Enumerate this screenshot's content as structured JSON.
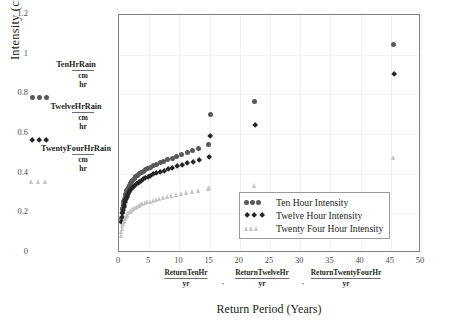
{
  "axes": {
    "ylabel": "Intensity (cm/hr)",
    "xlabel": "Return Period (Years)",
    "yticks": [
      "0",
      "0.2",
      "0.4",
      "0.6",
      "0.8",
      "1",
      "1.2"
    ],
    "xticks": [
      "0",
      "5",
      "10",
      "15",
      "20",
      "25",
      "30",
      "35",
      "40",
      "45",
      "50"
    ],
    "ylim": [
      0,
      1.2
    ],
    "xlim": [
      0,
      50
    ]
  },
  "variable_legend": [
    {
      "name": "TenHrRain",
      "numerator": "cm",
      "denominator": "hr",
      "marker": "circle",
      "color": "#595959"
    },
    {
      "name": "TwelveHrRain",
      "numerator": "cm",
      "denominator": "hr",
      "marker": "diamond",
      "color": "#262626"
    },
    {
      "name": "TwentyFourHrRain",
      "numerator": "cm",
      "denominator": "hr",
      "marker": "triangle",
      "color": "#c4c4c4"
    }
  ],
  "x_variable_labels": [
    {
      "name": "ReturnTenHr",
      "denominator": "yr"
    },
    {
      "name": "ReturnTwelveHr",
      "denominator": "yr"
    },
    {
      "name": "ReturnTwentyFourHr",
      "denominator": "yr"
    }
  ],
  "separator": ",",
  "legend": {
    "position": "inside-bottom-right",
    "items": [
      {
        "label": "Ten Hour Intensity",
        "marker": "circle",
        "color": "#595959"
      },
      {
        "label": "Twelve Hour Intensity",
        "marker": "diamond",
        "color": "#262626"
      },
      {
        "label": "Twenty Four Hour Intensity",
        "marker": "triangle",
        "color": "#c4c4c4"
      }
    ]
  },
  "chart_data": {
    "type": "scatter",
    "title": "",
    "xlabel": "Return Period (Years)",
    "ylabel": "Intensity (cm/hr)",
    "xlim": [
      0,
      50
    ],
    "ylim": [
      0,
      1.2
    ],
    "grid": true,
    "series": [
      {
        "name": "Ten Hour Intensity",
        "marker": "circle",
        "color": "#595959",
        "points": [
          [
            0.4,
            0.175
          ],
          [
            0.5,
            0.205
          ],
          [
            0.6,
            0.225
          ],
          [
            0.7,
            0.245
          ],
          [
            0.8,
            0.258
          ],
          [
            0.9,
            0.272
          ],
          [
            1.0,
            0.285
          ],
          [
            1.1,
            0.296
          ],
          [
            1.2,
            0.306
          ],
          [
            1.3,
            0.315
          ],
          [
            1.4,
            0.322
          ],
          [
            1.5,
            0.33
          ],
          [
            1.7,
            0.342
          ],
          [
            1.9,
            0.352
          ],
          [
            2.1,
            0.36
          ],
          [
            2.3,
            0.368
          ],
          [
            2.5,
            0.375
          ],
          [
            2.8,
            0.384
          ],
          [
            3.1,
            0.392
          ],
          [
            3.4,
            0.4
          ],
          [
            3.7,
            0.406
          ],
          [
            4.0,
            0.412
          ],
          [
            4.4,
            0.42
          ],
          [
            4.8,
            0.427
          ],
          [
            5.2,
            0.433
          ],
          [
            5.7,
            0.44
          ],
          [
            6.2,
            0.447
          ],
          [
            6.8,
            0.455
          ],
          [
            7.4,
            0.462
          ],
          [
            8.1,
            0.47
          ],
          [
            8.8,
            0.478
          ],
          [
            9.6,
            0.487
          ],
          [
            10.4,
            0.495
          ],
          [
            11.3,
            0.505
          ],
          [
            12.2,
            0.515
          ],
          [
            13.2,
            0.527
          ],
          [
            14.9,
            0.545
          ],
          [
            15.1,
            0.7
          ],
          [
            22.5,
            0.765
          ],
          [
            45.5,
            1.05
          ]
        ]
      },
      {
        "name": "Twelve Hour Intensity",
        "marker": "diamond",
        "color": "#262626",
        "points": [
          [
            0.4,
            0.155
          ],
          [
            0.5,
            0.18
          ],
          [
            0.6,
            0.2
          ],
          [
            0.7,
            0.218
          ],
          [
            0.8,
            0.23
          ],
          [
            0.9,
            0.243
          ],
          [
            1.0,
            0.254
          ],
          [
            1.1,
            0.264
          ],
          [
            1.2,
            0.273
          ],
          [
            1.3,
            0.281
          ],
          [
            1.4,
            0.288
          ],
          [
            1.5,
            0.295
          ],
          [
            1.7,
            0.306
          ],
          [
            1.9,
            0.315
          ],
          [
            2.1,
            0.322
          ],
          [
            2.3,
            0.33
          ],
          [
            2.5,
            0.336
          ],
          [
            2.8,
            0.345
          ],
          [
            3.1,
            0.352
          ],
          [
            3.4,
            0.358
          ],
          [
            3.7,
            0.364
          ],
          [
            4.0,
            0.37
          ],
          [
            4.4,
            0.377
          ],
          [
            4.8,
            0.383
          ],
          [
            5.2,
            0.389
          ],
          [
            5.7,
            0.395
          ],
          [
            6.2,
            0.401
          ],
          [
            6.8,
            0.408
          ],
          [
            7.4,
            0.414
          ],
          [
            8.1,
            0.421
          ],
          [
            8.8,
            0.428
          ],
          [
            9.6,
            0.436
          ],
          [
            10.4,
            0.443
          ],
          [
            11.3,
            0.452
          ],
          [
            12.2,
            0.46
          ],
          [
            13.2,
            0.47
          ],
          [
            14.9,
            0.485
          ],
          [
            15.1,
            0.59
          ],
          [
            22.5,
            0.645
          ],
          [
            45.5,
            0.9
          ]
        ]
      },
      {
        "name": "Twenty Four Hour Intensity",
        "marker": "triangle",
        "color": "#c4c4c4",
        "points": [
          [
            0.4,
            0.085
          ],
          [
            0.5,
            0.105
          ],
          [
            0.6,
            0.122
          ],
          [
            0.7,
            0.135
          ],
          [
            0.8,
            0.146
          ],
          [
            0.9,
            0.155
          ],
          [
            1.0,
            0.163
          ],
          [
            1.1,
            0.17
          ],
          [
            1.2,
            0.176
          ],
          [
            1.3,
            0.182
          ],
          [
            1.4,
            0.187
          ],
          [
            1.5,
            0.192
          ],
          [
            1.7,
            0.2
          ],
          [
            1.9,
            0.207
          ],
          [
            2.1,
            0.212
          ],
          [
            2.3,
            0.217
          ],
          [
            2.5,
            0.222
          ],
          [
            2.8,
            0.228
          ],
          [
            3.1,
            0.233
          ],
          [
            3.4,
            0.238
          ],
          [
            3.7,
            0.242
          ],
          [
            4.0,
            0.246
          ],
          [
            4.4,
            0.251
          ],
          [
            4.8,
            0.255
          ],
          [
            5.2,
            0.259
          ],
          [
            5.7,
            0.264
          ],
          [
            6.2,
            0.268
          ],
          [
            6.8,
            0.273
          ],
          [
            7.4,
            0.277
          ],
          [
            8.1,
            0.282
          ],
          [
            8.8,
            0.287
          ],
          [
            9.6,
            0.292
          ],
          [
            10.4,
            0.297
          ],
          [
            11.3,
            0.303
          ],
          [
            12.2,
            0.309
          ],
          [
            13.2,
            0.315
          ],
          [
            14.9,
            0.325
          ],
          [
            15.1,
            0.33
          ],
          [
            22.5,
            0.34
          ],
          [
            45.5,
            0.48
          ]
        ]
      }
    ]
  }
}
